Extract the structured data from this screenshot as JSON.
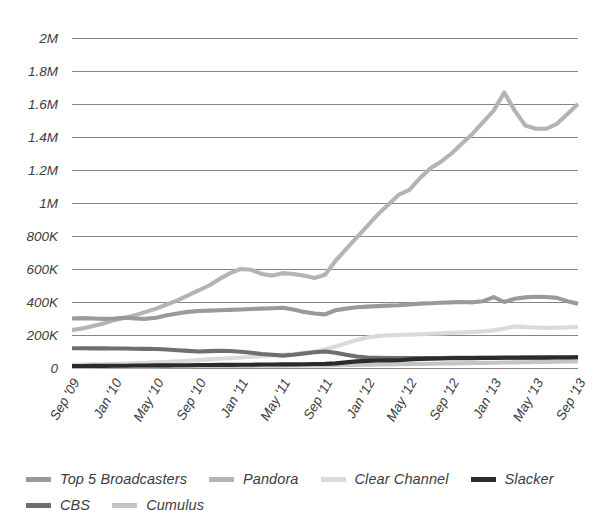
{
  "chart_data": {
    "type": "line",
    "title": "",
    "subtitle": "",
    "xlabel": "",
    "ylabel": "",
    "grid": true,
    "legend_position": "bottom-left",
    "ylim": [
      0,
      2000000
    ],
    "y_ticks": [
      {
        "value": 2000000,
        "label": "2M"
      },
      {
        "value": 1800000,
        "label": "1.8M"
      },
      {
        "value": 1600000,
        "label": "1.6M"
      },
      {
        "value": 1400000,
        "label": "1.4M"
      },
      {
        "value": 1200000,
        "label": "1.2M"
      },
      {
        "value": 1000000,
        "label": "1M"
      },
      {
        "value": 800000,
        "label": "800K"
      },
      {
        "value": 600000,
        "label": "600K"
      },
      {
        "value": 400000,
        "label": "400K"
      },
      {
        "value": 200000,
        "label": "200K"
      },
      {
        "value": 0,
        "label": "0"
      }
    ],
    "x_tick_labels": [
      "Sep '09",
      "Jan '10",
      "May '10",
      "Sep '10",
      "Jan '11",
      "May '11",
      "Sep '11",
      "Jan '12",
      "May '12",
      "Sep '12",
      "Jan '13",
      "May '13",
      "Sep '13"
    ],
    "x_tick_indices": [
      0,
      4,
      8,
      12,
      16,
      20,
      24,
      28,
      32,
      36,
      40,
      44,
      48
    ],
    "x_months": [
      "Sep '09",
      "Oct '09",
      "Nov '09",
      "Dec '09",
      "Jan '10",
      "Feb '10",
      "Mar '10",
      "Apr '10",
      "May '10",
      "Jun '10",
      "Jul '10",
      "Aug '10",
      "Sep '10",
      "Oct '10",
      "Nov '10",
      "Dec '10",
      "Jan '11",
      "Feb '11",
      "Mar '11",
      "Apr '11",
      "May '11",
      "Jun '11",
      "Jul '11",
      "Aug '11",
      "Sep '11",
      "Oct '11",
      "Nov '11",
      "Dec '11",
      "Jan '12",
      "Feb '12",
      "Mar '12",
      "Apr '12",
      "May '12",
      "Jun '12",
      "Jul '12",
      "Aug '12",
      "Sep '12",
      "Oct '12",
      "Nov '12",
      "Dec '12",
      "Jan '13",
      "Feb '13",
      "Mar '13",
      "Apr '13",
      "May '13",
      "Jun '13",
      "Jul '13",
      "Aug '13",
      "Sep '13"
    ],
    "series": [
      {
        "name": "Top 5 Broadcasters",
        "color": "#9a9a9a",
        "values": [
          300000,
          302000,
          300000,
          298000,
          300000,
          305000,
          300000,
          298000,
          305000,
          320000,
          330000,
          340000,
          345000,
          348000,
          350000,
          352000,
          355000,
          358000,
          360000,
          362000,
          365000,
          355000,
          340000,
          330000,
          325000,
          350000,
          360000,
          368000,
          372000,
          375000,
          378000,
          380000,
          385000,
          390000,
          392000,
          395000,
          398000,
          400000,
          398000,
          405000,
          430000,
          400000,
          420000,
          428000,
          432000,
          430000,
          425000,
          405000,
          390000
        ]
      },
      {
        "name": "Pandora",
        "color": "#b4b4b4",
        "values": [
          230000,
          240000,
          255000,
          270000,
          290000,
          305000,
          320000,
          340000,
          360000,
          385000,
          410000,
          440000,
          470000,
          500000,
          540000,
          575000,
          600000,
          595000,
          570000,
          560000,
          575000,
          570000,
          560000,
          545000,
          565000,
          650000,
          720000,
          790000,
          860000,
          930000,
          990000,
          1050000,
          1080000,
          1150000,
          1210000,
          1250000,
          1300000,
          1360000,
          1420000,
          1490000,
          1560000,
          1670000,
          1560000,
          1470000,
          1450000,
          1450000,
          1480000,
          1540000,
          1600000
        ]
      },
      {
        "name": "Clear Channel",
        "color": "#dadada",
        "values": [
          20000,
          21000,
          22000,
          23000,
          25000,
          27000,
          29000,
          31000,
          34000,
          37000,
          40000,
          44000,
          48000,
          52000,
          56000,
          60000,
          64000,
          68000,
          72000,
          76000,
          80000,
          85000,
          92000,
          100000,
          112000,
          130000,
          150000,
          170000,
          185000,
          193000,
          198000,
          200000,
          202000,
          205000,
          208000,
          210000,
          213000,
          215000,
          218000,
          222000,
          228000,
          240000,
          252000,
          248000,
          245000,
          243000,
          244000,
          246000,
          250000
        ]
      },
      {
        "name": "Slacker",
        "color": "#2b2b2b",
        "values": [
          12000,
          12000,
          13000,
          13000,
          14000,
          14000,
          15000,
          15000,
          16000,
          16000,
          17000,
          17000,
          18000,
          18000,
          19000,
          19000,
          20000,
          20000,
          21000,
          21000,
          22000,
          22000,
          23000,
          24000,
          25000,
          28000,
          34000,
          40000,
          43000,
          45000,
          46000,
          47000,
          52000,
          55000,
          57000,
          58000,
          59000,
          60000,
          60000,
          61000,
          61000,
          62000,
          62000,
          63000,
          63000,
          63000,
          64000,
          64000,
          65000
        ]
      },
      {
        "name": "CBS",
        "color": "#6e6e6e",
        "values": [
          120000,
          120000,
          119000,
          119000,
          118000,
          118000,
          117000,
          116000,
          115000,
          112000,
          108000,
          104000,
          100000,
          102000,
          105000,
          103000,
          98000,
          92000,
          85000,
          80000,
          75000,
          80000,
          88000,
          95000,
          100000,
          92000,
          80000,
          70000,
          64000,
          62000,
          61000,
          60000,
          60000,
          60000,
          61000,
          61000,
          62000,
          62000,
          62000,
          63000,
          63000,
          63000,
          64000,
          64000,
          64000,
          65000,
          65000,
          65000,
          66000
        ]
      },
      {
        "name": "Cumulus",
        "color": "#c4c4c4",
        "values": [
          8000,
          8000,
          8000,
          9000,
          9000,
          9000,
          10000,
          10000,
          10000,
          11000,
          11000,
          11000,
          12000,
          12000,
          12000,
          13000,
          13000,
          13000,
          14000,
          14000,
          14000,
          15000,
          15000,
          16000,
          16000,
          17000,
          18000,
          19000,
          20000,
          21000,
          22000,
          23000,
          24000,
          25000,
          26000,
          27000,
          28000,
          29000,
          30000,
          31000,
          32000,
          33000,
          34000,
          35000,
          36000,
          37000,
          38000,
          39000,
          40000
        ]
      }
    ]
  },
  "legend": {
    "rows": [
      [
        {
          "label": "Top 5 Broadcasters",
          "color": "#9a9a9a",
          "name": "legend-item-top-5-broadcasters"
        },
        {
          "label": "Pandora",
          "color": "#b4b4b4",
          "name": "legend-item-pandora"
        },
        {
          "label": "Clear Channel",
          "color": "#dadada",
          "name": "legend-item-clear-channel"
        },
        {
          "label": "Slacker",
          "color": "#2b2b2b",
          "name": "legend-item-slacker"
        }
      ],
      [
        {
          "label": "CBS",
          "color": "#6e6e6e",
          "name": "legend-item-cbs"
        },
        {
          "label": "Cumulus",
          "color": "#c4c4c4",
          "name": "legend-item-cumulus"
        }
      ]
    ]
  },
  "style": {
    "background": "#ffffff",
    "gridline_color": "#77787a",
    "tick_text_color": "#3d3d3d"
  }
}
